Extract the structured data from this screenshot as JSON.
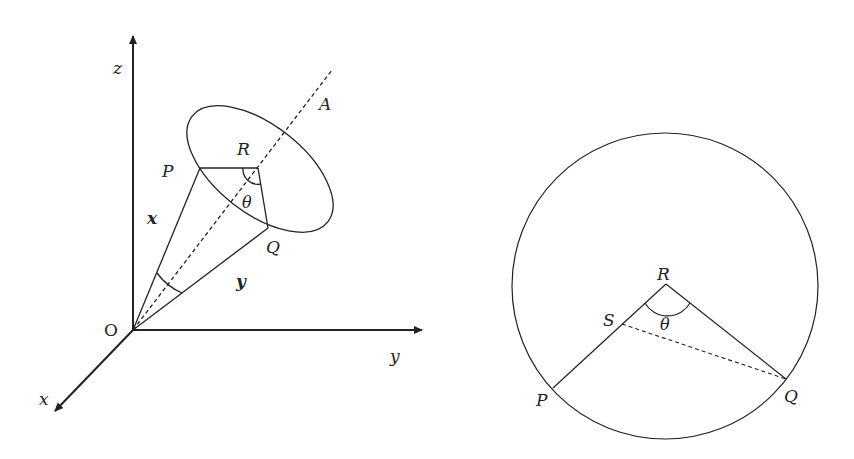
{
  "left_figure": {
    "axes": {
      "z_label": "z",
      "y_label": "y",
      "x_label": "x",
      "origin_label": "O"
    },
    "points": {
      "A": "A",
      "R": "R",
      "P": "P",
      "Q": "Q"
    },
    "vectors": {
      "x": "x",
      "y": "y"
    },
    "angle": "θ"
  },
  "right_figure": {
    "points": {
      "R": "R",
      "S": "S",
      "P": "P",
      "Q": "Q"
    },
    "angle": "θ"
  },
  "colors": {
    "stroke": "#222222",
    "background": "#ffffff"
  }
}
